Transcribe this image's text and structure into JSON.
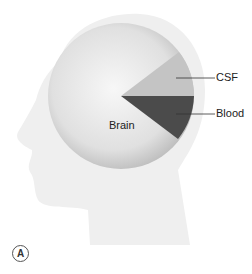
{
  "figure": {
    "panel_label": "A",
    "segments": [
      {
        "label": "Brain",
        "color": "#e2e2e2"
      },
      {
        "label": "CSF",
        "color": "#c2c2c2"
      },
      {
        "label": "Blood",
        "color": "#4a4a4a"
      }
    ],
    "head_color": "#efefef"
  }
}
